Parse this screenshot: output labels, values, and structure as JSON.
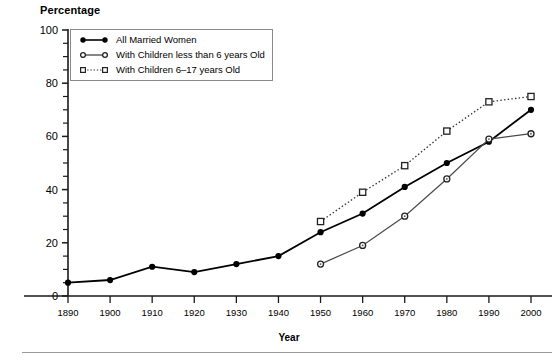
{
  "axis_titles": {
    "y": "Percentage",
    "x": "Year"
  },
  "legend": {
    "entries": [
      {
        "label": "All Married Women",
        "marker": "filled-circle-icon",
        "line": "solid",
        "color": "#000000"
      },
      {
        "label": "With Children less than 6 years Old",
        "marker": "open-circle-icon",
        "line": "solid",
        "color": "#444444"
      },
      {
        "label": "With Children 6–17 years Old",
        "marker": "open-square-icon",
        "line": "dotted",
        "color": "#333333"
      }
    ]
  },
  "chart_data": {
    "type": "line",
    "title": "",
    "subtitle": "",
    "xlabel": "Year",
    "ylabel": "Percentage",
    "x": [
      1890,
      1900,
      1910,
      1920,
      1930,
      1940,
      1950,
      1960,
      1970,
      1980,
      1990,
      2000
    ],
    "xtick_labels": [
      "1890",
      "1900",
      "1910",
      "1920",
      "1930",
      "1940",
      "1950",
      "1960",
      "1970",
      "1980",
      "1990",
      "2000"
    ],
    "xlim": [
      1890,
      2000
    ],
    "ylim": [
      0,
      100
    ],
    "ytick_labels": [
      "0",
      "20",
      "40",
      "60",
      "80",
      "100"
    ],
    "ytick_values": [
      0,
      20,
      40,
      60,
      80,
      100
    ],
    "yminor_step": 5,
    "grid": false,
    "legend_position": "upper-left-inside",
    "series": [
      {
        "name": "All Married Women",
        "marker": "filled-circle",
        "line_style": "solid",
        "color": "#000000",
        "x": [
          1890,
          1900,
          1910,
          1920,
          1930,
          1940,
          1950,
          1960,
          1970,
          1980,
          1990,
          2000
        ],
        "values": [
          5,
          6,
          11,
          9,
          12,
          15,
          24,
          31,
          41,
          50,
          58,
          70
        ]
      },
      {
        "name": "With Children less than 6 years Old",
        "marker": "open-circle",
        "line_style": "solid",
        "color": "#4a4a4a",
        "x": [
          1950,
          1960,
          1970,
          1980,
          1990,
          2000
        ],
        "values": [
          12,
          19,
          30,
          44,
          59,
          61
        ]
      },
      {
        "name": "With Children 6–17 years Old",
        "marker": "open-square",
        "line_style": "dotted",
        "color": "#333333",
        "x": [
          1950,
          1960,
          1970,
          1980,
          1990,
          2000
        ],
        "values": [
          28,
          39,
          49,
          62,
          73,
          75
        ]
      }
    ]
  }
}
